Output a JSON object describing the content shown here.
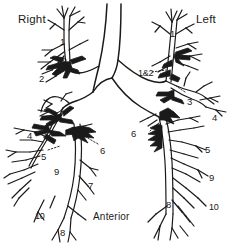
{
  "figure": {
    "background_color": "#ffffff",
    "ink_color": "#1a1a1a",
    "view": "Anterior view of the tracheobronchial tree",
    "orientation_labels": {
      "right": "Right",
      "left": "Left",
      "anterior": "Anterior"
    },
    "segment_labels": {
      "right": [
        {
          "text": "1",
          "x": 60,
          "y": 37
        },
        {
          "text": "2",
          "x": 39,
          "y": 74
        },
        {
          "text": "3",
          "x": 57,
          "y": 112
        },
        {
          "text": "4",
          "x": 27,
          "y": 131
        },
        {
          "text": "5",
          "x": 41,
          "y": 152
        },
        {
          "text": "6",
          "x": 100,
          "y": 146
        },
        {
          "text": "7",
          "x": 88,
          "y": 181
        },
        {
          "text": "8",
          "x": 60,
          "y": 228
        },
        {
          "text": "9",
          "x": 54,
          "y": 167
        },
        {
          "text": "10",
          "x": 35,
          "y": 212
        }
      ],
      "left": [
        {
          "text": "1",
          "x": 170,
          "y": 29
        },
        {
          "text": "1&2",
          "x": 138,
          "y": 73
        },
        {
          "text": "3",
          "x": 187,
          "y": 97
        },
        {
          "text": "4",
          "x": 212,
          "y": 113
        },
        {
          "text": "5",
          "x": 205,
          "y": 145
        },
        {
          "text": "6",
          "x": 141,
          "y": 133
        },
        {
          "text": "8",
          "x": 166,
          "y": 200
        },
        {
          "text": "9",
          "x": 209,
          "y": 173
        },
        {
          "text": "10",
          "x": 211,
          "y": 203
        }
      ]
    },
    "segment_legend": [
      "1 apical",
      "2 posterior",
      "3 anterior",
      "4 lateral / superior lingular",
      "5 medial / inferior lingular",
      "6 superior basal",
      "7 medial basal",
      "8 anterior basal",
      "9 lateral basal",
      "10 posterior basal"
    ]
  }
}
